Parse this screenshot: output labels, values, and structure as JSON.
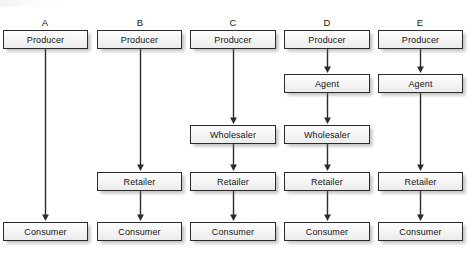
{
  "diagram": {
    "background_color": "#ffffff",
    "box_fill_color": "#f4f4f4",
    "box_border_color": "#2b2b2b",
    "arrow_color": "#2b2b2b",
    "text_color": "#151515",
    "shadow_color": "#9b9b9b"
  },
  "columns": [
    {
      "letter": "A",
      "center_x": 45,
      "box_left": 3,
      "box_width": 85,
      "nodes": [
        {
          "label": "Producer",
          "row": "producer",
          "y": 30
        },
        {
          "label": "Consumer",
          "row": "consumer",
          "y": 222
        }
      ],
      "arrows": [
        {
          "from": "Producer",
          "to": "Consumer",
          "y_start": 49,
          "y_end": 221
        }
      ]
    },
    {
      "letter": "B",
      "center_x": 140,
      "box_left": 97,
      "box_width": 85,
      "nodes": [
        {
          "label": "Producer",
          "row": "producer",
          "y": 30
        },
        {
          "label": "Retailer",
          "row": "retailer",
          "y": 172
        },
        {
          "label": "Consumer",
          "row": "consumer",
          "y": 222
        }
      ],
      "arrows": [
        {
          "from": "Producer",
          "to": "Retailer",
          "y_start": 49,
          "y_end": 171
        },
        {
          "from": "Retailer",
          "to": "Consumer",
          "y_start": 191,
          "y_end": 221
        }
      ]
    },
    {
      "letter": "C",
      "center_x": 233,
      "box_left": 190,
      "box_width": 86,
      "nodes": [
        {
          "label": "Producer",
          "row": "producer",
          "y": 30
        },
        {
          "label": "Wholesaler",
          "row": "wholesaler",
          "y": 125
        },
        {
          "label": "Retailer",
          "row": "retailer",
          "y": 172
        },
        {
          "label": "Consumer",
          "row": "consumer",
          "y": 222
        }
      ],
      "arrows": [
        {
          "from": "Producer",
          "to": "Wholesaler",
          "y_start": 49,
          "y_end": 124
        },
        {
          "from": "Wholesaler",
          "to": "Retailer",
          "y_start": 144,
          "y_end": 171
        },
        {
          "from": "Retailer",
          "to": "Consumer",
          "y_start": 191,
          "y_end": 221
        }
      ]
    },
    {
      "letter": "D",
      "center_x": 327,
      "box_left": 284,
      "box_width": 86,
      "nodes": [
        {
          "label": "Producer",
          "row": "producer",
          "y": 30
        },
        {
          "label": "Agent",
          "row": "agent",
          "y": 74
        },
        {
          "label": "Wholesaler",
          "row": "wholesaler",
          "y": 125
        },
        {
          "label": "Retailer",
          "row": "retailer",
          "y": 172
        },
        {
          "label": "Consumer",
          "row": "consumer",
          "y": 222
        }
      ],
      "arrows": [
        {
          "from": "Producer",
          "to": "Agent",
          "y_start": 49,
          "y_end": 73
        },
        {
          "from": "Agent",
          "to": "Wholesaler",
          "y_start": 93,
          "y_end": 124
        },
        {
          "from": "Wholesaler",
          "to": "Retailer",
          "y_start": 144,
          "y_end": 171
        },
        {
          "from": "Retailer",
          "to": "Consumer",
          "y_start": 191,
          "y_end": 221
        }
      ]
    },
    {
      "letter": "E",
      "center_x": 420,
      "box_left": 378,
      "box_width": 85,
      "nodes": [
        {
          "label": "Producer",
          "row": "producer",
          "y": 30
        },
        {
          "label": "Agent",
          "row": "agent",
          "y": 74
        },
        {
          "label": "Retailer",
          "row": "retailer",
          "y": 172
        },
        {
          "label": "Consumer",
          "row": "consumer",
          "y": 222
        }
      ],
      "arrows": [
        {
          "from": "Producer",
          "to": "Agent",
          "y_start": 49,
          "y_end": 73
        },
        {
          "from": "Agent",
          "to": "Retailer",
          "y_start": 93,
          "y_end": 171
        },
        {
          "from": "Retailer",
          "to": "Consumer",
          "y_start": 191,
          "y_end": 221
        }
      ]
    }
  ],
  "letters_y": 18
}
